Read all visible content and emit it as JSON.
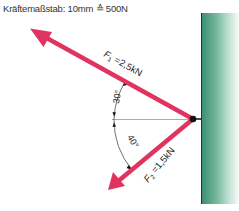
{
  "header": {
    "scale_label": "Kräftemaßstab: 10mm ≙ 500N"
  },
  "forces": [
    {
      "name": "F1",
      "label_main": "F",
      "label_sub": "1",
      "label_value": " =2,5kN",
      "magnitude_kN": 2.5,
      "angle_deg": 30,
      "direction": "up-left"
    },
    {
      "name": "F2",
      "label_main": "F",
      "label_sub": "2",
      "label_value": " =1,5kN",
      "magnitude_kN": 1.5,
      "angle_deg": 40,
      "direction": "down-left"
    }
  ],
  "angles": {
    "upper": "30°",
    "lower": "40°"
  },
  "colors": {
    "force_arrow": "#e0335f",
    "wall_dark": "#3e8f72",
    "node": "#111111"
  }
}
